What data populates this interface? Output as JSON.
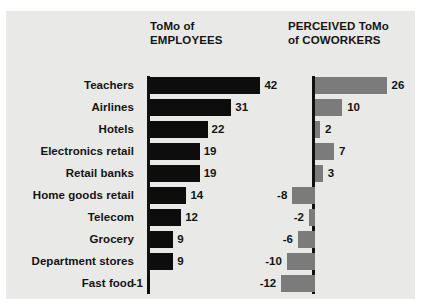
{
  "figure": {
    "top_cut_fragments": [
      "•",
      "•",
      "–",
      "–"
    ],
    "panel_color": "#e9e9e7",
    "left_series_color": "#0d0d0d",
    "right_series_color": "#7b7b7b",
    "axis_color": "#101010"
  },
  "headers": {
    "left": "ToMo of\nEMPLOYEES",
    "right": "PERCEIVED ToMo\nof COWORKERS"
  },
  "chart_data": {
    "type": "bar",
    "title": "",
    "xlabel": "",
    "ylabel": "",
    "orientation": "horizontal",
    "grid": false,
    "legend_position": "top",
    "categories": [
      "Teachers",
      "Airlines",
      "Hotels",
      "Electronics retail",
      "Retail banks",
      "Home goods retail",
      "Telecom",
      "Grocery",
      "Department stores",
      "Fast food"
    ],
    "series": [
      {
        "name": "ToMo of EMPLOYEES",
        "color": "#0d0d0d",
        "values": [
          42,
          31,
          22,
          19,
          19,
          14,
          12,
          9,
          9,
          -1
        ],
        "labels": [
          "42",
          "31",
          "22",
          "19",
          "19",
          "14",
          "12",
          "9",
          "9",
          "-1"
        ],
        "xlim": [
          -4,
          46
        ]
      },
      {
        "name": "PERCEIVED ToMo of COWORKERS",
        "color": "#7b7b7b",
        "values": [
          26,
          10,
          2,
          7,
          3,
          -8,
          -2,
          -6,
          -10,
          -12
        ],
        "labels": [
          "26",
          "10",
          "2",
          "7",
          "3",
          "-8",
          "-2",
          "-6",
          "-10",
          "-12"
        ],
        "xlim": [
          -14,
          28
        ]
      }
    ]
  }
}
